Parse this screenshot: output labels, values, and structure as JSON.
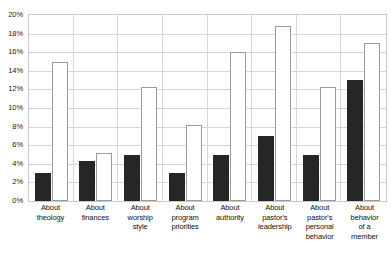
{
  "chart_data": {
    "type": "bar",
    "title": "",
    "subtitle": "",
    "xlabel": "",
    "ylabel": "",
    "ylim": [
      0,
      20
    ],
    "y_unit": "%",
    "grid": true,
    "legend": "none",
    "orientation": "vertical",
    "grouping": "grouped",
    "categories": [
      "About theology",
      "About finances",
      "About worship style",
      "About program priorities",
      "About authority",
      "About pastor's leadership",
      "About pastor's personal behavior",
      "About behavior of a member"
    ],
    "category_lines": [
      [
        "About",
        "theology"
      ],
      [
        "About",
        "finances"
      ],
      [
        "About",
        "worship",
        "style"
      ],
      [
        "About",
        "program",
        "priorities"
      ],
      [
        "About",
        "authority"
      ],
      [
        "About",
        "pastor's",
        "leadership"
      ],
      [
        "About",
        "pastor's",
        "personal",
        "behavior"
      ],
      [
        "About",
        "behavior",
        "of a",
        "member"
      ]
    ],
    "series": [
      {
        "name": "Series 1",
        "style": "filled-black",
        "color": "#262626",
        "values": [
          3.0,
          4.3,
          5.0,
          3.0,
          5.0,
          7.0,
          5.0,
          13.0
        ]
      },
      {
        "name": "Series 2",
        "style": "outlined-white",
        "color": "#ffffff",
        "border_color": "#9a9a9a",
        "values": [
          15.0,
          5.2,
          12.3,
          8.2,
          16.0,
          18.8,
          12.3,
          17.0
        ]
      }
    ],
    "y_ticks": [
      {
        "value": 20,
        "label": "20%"
      },
      {
        "value": 18,
        "label": "18%"
      },
      {
        "value": 16,
        "label": "16%"
      },
      {
        "value": 14,
        "label": "14%"
      },
      {
        "value": 12,
        "label": "12%"
      },
      {
        "value": 10,
        "label": "10%"
      },
      {
        "value": 8,
        "label": "8%"
      },
      {
        "value": 6,
        "label": "6%"
      },
      {
        "value": 4,
        "label": "4%"
      },
      {
        "value": 2,
        "label": "2%"
      },
      {
        "value": 0,
        "label": "0%"
      }
    ]
  }
}
